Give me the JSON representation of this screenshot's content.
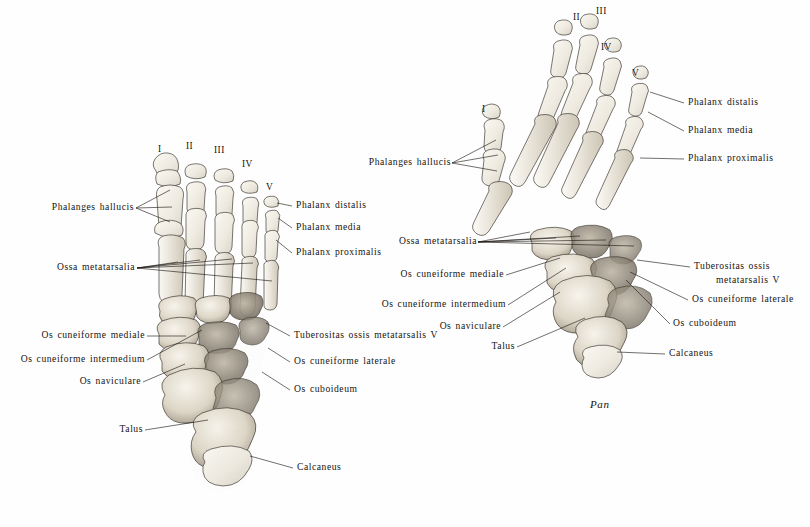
{
  "plate": {
    "title": "Comparative foot skeleton plate",
    "background_color": "#fefefe",
    "ink_color": "#16130f"
  },
  "figures": [
    {
      "id": "left-figure",
      "name": "human-foot-dorsal",
      "caption": "",
      "digit_numerals": [
        "I",
        "II",
        "III",
        "IV",
        "V"
      ],
      "labels_left": [
        "Phalanges hallucis",
        "Ossa metatarsalia",
        "Os cuneiforme mediale",
        "Os cuneiforme intermedium",
        "Os naviculare",
        "Talus"
      ],
      "labels_right": [
        "Phalanx distalis",
        "Phalanx media",
        "Phalanx proximalis",
        "Tuberositas ossis metatarsalis V",
        "Os cuneiforme laterale",
        "Os cuboideum",
        "Calcaneus"
      ]
    },
    {
      "id": "right-figure",
      "name": "pan-foot-dorsal",
      "caption": "Pan",
      "caption_first": "P",
      "caption_rest": "an",
      "digit_numerals": [
        "I",
        "II",
        "III",
        "IV",
        "V"
      ],
      "labels_left": [
        "Phalanges hallucis",
        "Ossa metatarsalia",
        "Os cuneiforme mediale",
        "Os cuneiforme intermedium",
        "Os naviculare",
        "Talus"
      ],
      "labels_right": [
        "Phalanx distalis",
        "Phalanx media",
        "Phalanx proximalis",
        "Tuberositas ossis",
        "metatarsalis V",
        "Os cuneiforme laterale",
        "Os cuboideum",
        "Calcaneus"
      ]
    }
  ],
  "left_figure_labels": {
    "phalanges_hallucis": "Phalanges hallucis",
    "ossa_metatarsalia": "Ossa metatarsalia",
    "os_cuneiforme_mediale": "Os cuneiforme mediale",
    "os_cuneiforme_intermedium": "Os cuneiforme intermedium",
    "os_naviculare": "Os naviculare",
    "talus": "Talus",
    "phalanx_distalis": "Phalanx distalis",
    "phalanx_media": "Phalanx media",
    "phalanx_proximalis": "Phalanx proximalis",
    "tuberositas": "Tuberositas ossis metatarsalis V",
    "os_cuneiforme_laterale": "Os cuneiforme laterale",
    "os_cuboideum": "Os cuboideum",
    "calcaneus": "Calcaneus",
    "numeral_1": "I",
    "numeral_2": "II",
    "numeral_3": "III",
    "numeral_4": "IV",
    "numeral_5": "V"
  },
  "right_figure_labels": {
    "phalanges_hallucis": "Phalanges hallucis",
    "ossa_metatarsalia": "Ossa metatarsalia",
    "os_cuneiforme_mediale": "Os cuneiforme mediale",
    "os_cuneiforme_intermedium": "Os cuneiforme intermedium",
    "os_naviculare": "Os naviculare",
    "talus": "Talus",
    "phalanx_distalis": "Phalanx distalis",
    "phalanx_media": "Phalanx media",
    "phalanx_proximalis": "Phalanx proximalis",
    "tuberositas_line1": "Tuberositas ossis",
    "tuberositas_line2": "metatarsalis V",
    "os_cuneiforme_laterale": "Os cuneiforme laterale",
    "os_cuboideum": "Os cuboideum",
    "calcaneus": "Calcaneus",
    "caption": "Pan",
    "numeral_1": "I",
    "numeral_2": "II",
    "numeral_3": "III",
    "numeral_4": "IV",
    "numeral_5": "V"
  }
}
